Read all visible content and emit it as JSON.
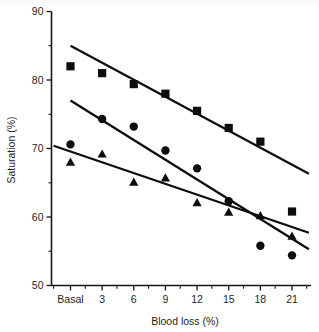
{
  "chart_data": {
    "type": "scatter",
    "title": "",
    "xlabel": "Blood loss (%)",
    "ylabel": "Saturation (%)",
    "categories": [
      "Basal",
      "3",
      "6",
      "9",
      "12",
      "15",
      "18",
      "21"
    ],
    "x": [
      0,
      3,
      6,
      9,
      12,
      15,
      18,
      21
    ],
    "xlim": [
      -1.8,
      22.8
    ],
    "ylim": [
      50,
      90
    ],
    "xticks": [
      "Basal",
      "3",
      "6",
      "9",
      "12",
      "15",
      "18",
      "21"
    ],
    "yticks": [
      "50",
      "60",
      "70",
      "80",
      "90"
    ],
    "ytick_values": [
      50,
      60,
      70,
      80,
      90
    ],
    "y_minor_step": 5,
    "x_minor_step": 1.5,
    "grid": false,
    "legend": "none",
    "series": [
      {
        "name": "Square series",
        "marker": "square",
        "color": "#0d0d0d",
        "values": [
          82.0,
          81.0,
          79.4,
          78.0,
          75.5,
          73.0,
          71.0,
          60.8
        ],
        "trendline": {
          "x0": 0,
          "y0": 85.0,
          "x1": 22.6,
          "y1": 66.3
        }
      },
      {
        "name": "Circle series",
        "marker": "circle",
        "color": "#0d0d0d",
        "values": [
          70.6,
          74.3,
          73.2,
          69.7,
          67.1,
          62.3,
          55.8,
          54.4
        ],
        "trendline": {
          "x0": 0,
          "y0": 77.0,
          "x1": 22.6,
          "y1": 55.3
        }
      },
      {
        "name": "Triangle series",
        "marker": "triangle",
        "color": "#0d0d0d",
        "values": [
          68.0,
          69.2,
          65.1,
          65.7,
          62.1,
          60.7,
          60.2,
          57.2
        ],
        "trendline": {
          "x0": -1.6,
          "y0": 70.4,
          "x1": 22.6,
          "y1": 57.7
        }
      }
    ]
  },
  "axes": {
    "y_title": "Saturation (%)",
    "x_title": "Blood loss (%)",
    "y_tick_labels": [
      "90",
      "80",
      "70",
      "60",
      "50"
    ],
    "x_tick_labels": [
      "Basal",
      "3",
      "6",
      "9",
      "12",
      "15",
      "18",
      "21"
    ]
  },
  "caption": {
    "text": ""
  }
}
